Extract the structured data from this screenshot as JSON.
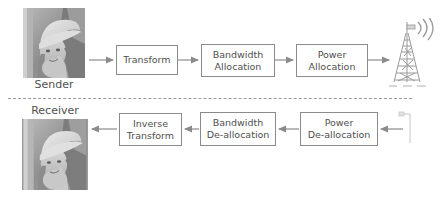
{
  "diagram": {
    "line_color": "#8b8b8b",
    "text_color": "#4f4f4f",
    "divider_color": "#9a9a9a",
    "sender": {
      "caption": "Sender",
      "image_alt": "lena-grayscale-image",
      "blocks": [
        {
          "id": "transform",
          "label": "Transform"
        },
        {
          "id": "bandwidth-allocation",
          "label": "Bandwidth\nAllocation"
        },
        {
          "id": "power-allocation",
          "label": "Power\nAllocation"
        }
      ],
      "endpoint": "transmit-antenna-tower"
    },
    "receiver": {
      "caption": "Receiver",
      "image_alt": "lena-grayscale-image",
      "blocks": [
        {
          "id": "inverse-transform",
          "label": "Inverse\nTransform"
        },
        {
          "id": "bandwidth-de-allocation",
          "label": "Bandwidth\nDe-allocation"
        },
        {
          "id": "power-de-allocation",
          "label": "Power\nDe-allocation"
        }
      ],
      "endpoint": "receive-antenna"
    }
  }
}
